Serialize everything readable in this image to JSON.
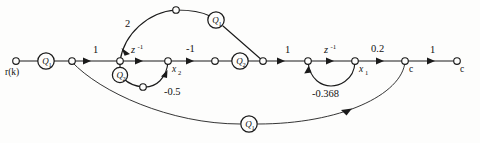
{
  "diagram": {
    "type": "signal-flow-graph",
    "title": "",
    "stroke_color": "#1a1a1a",
    "background_color": "#fdfdfc",
    "nodes": [
      {
        "id": "r",
        "label": "r(k)",
        "label_sub": "",
        "x": 16,
        "y": 61,
        "kind": "open"
      },
      {
        "id": "n1",
        "label": "",
        "label_sub": "",
        "x": 72,
        "y": 61,
        "kind": "open"
      },
      {
        "id": "n2",
        "label": "",
        "label_sub": "",
        "x": 120,
        "y": 61,
        "kind": "open"
      },
      {
        "id": "x2",
        "label": "x",
        "label_sub": "2",
        "x": 168,
        "y": 61,
        "kind": "open"
      },
      {
        "id": "n4",
        "label": "",
        "label_sub": "",
        "x": 215,
        "y": 61,
        "kind": "open"
      },
      {
        "id": "n5",
        "label": "",
        "label_sub": "",
        "x": 263,
        "y": 61,
        "kind": "open"
      },
      {
        "id": "n6",
        "label": "",
        "label_sub": "",
        "x": 308,
        "y": 61,
        "kind": "open"
      },
      {
        "id": "x1",
        "label": "x",
        "label_sub": "1",
        "x": 355,
        "y": 61,
        "kind": "open"
      },
      {
        "id": "c1",
        "label": "c",
        "label_sub": "",
        "x": 405,
        "y": 61,
        "kind": "open"
      },
      {
        "id": "c2",
        "label": "c",
        "label_sub": "",
        "x": 457,
        "y": 61,
        "kind": "open"
      },
      {
        "id": "top_mid",
        "label": "",
        "label_sub": "",
        "x": 176,
        "y": 10,
        "kind": "open"
      },
      {
        "id": "q2_mid",
        "label": "",
        "label_sub": "",
        "x": 143,
        "y": 87,
        "kind": "open"
      }
    ],
    "gain_circles": [
      {
        "id": "q1_in",
        "label": "Q",
        "label_sub": "1",
        "x": 46,
        "y": 61
      },
      {
        "id": "q2_small",
        "label": "Q",
        "label_sub": "2",
        "x": 120,
        "y": 75
      },
      {
        "id": "q1_top",
        "label": "Q",
        "label_sub": "1",
        "x": 216,
        "y": 20
      },
      {
        "id": "q2_mainline",
        "label": "Q",
        "label_sub": "2",
        "x": 240,
        "y": 61
      },
      {
        "id": "q1_bottom",
        "label": "Q",
        "label_sub": "1",
        "x": 249,
        "y": 124
      }
    ],
    "edge_labels": [
      {
        "id": "g_one_a",
        "text": "1",
        "x": 96,
        "y": 50,
        "style": "plain"
      },
      {
        "id": "g_two",
        "text": "2",
        "x": 128,
        "y": 23,
        "style": "plain"
      },
      {
        "id": "g_zinv_1",
        "text": "z",
        "sup": "-1",
        "x": 137,
        "y": 50,
        "style": "sup-italic"
      },
      {
        "id": "g_neg_one",
        "text": "-1",
        "x": 192,
        "y": 49,
        "style": "plain"
      },
      {
        "id": "g_neg_half",
        "text": "-0.5",
        "x": 174,
        "y": 91,
        "style": "plain"
      },
      {
        "id": "g_one_b",
        "text": "1",
        "x": 287,
        "y": 50,
        "style": "plain"
      },
      {
        "id": "g_zinv_2",
        "text": "z",
        "sup": "-1",
        "x": 330,
        "y": 49,
        "style": "sup-italic"
      },
      {
        "id": "g_neg_368",
        "text": "-0.368",
        "x": 332,
        "y": 93,
        "style": "plain"
      },
      {
        "id": "g_point2",
        "text": "0.2",
        "x": 380,
        "y": 49,
        "style": "plain"
      },
      {
        "id": "g_one_c",
        "text": "1",
        "x": 432,
        "y": 50,
        "style": "plain"
      }
    ],
    "branches": [
      {
        "id": "b_r_q1",
        "from": "r",
        "to": "q1_in",
        "gain": ""
      },
      {
        "id": "b_q1_n1",
        "from": "q1_in",
        "to": "n1",
        "gain": ""
      },
      {
        "id": "b_n1_n2",
        "from": "n1",
        "to": "n2",
        "gain": "1"
      },
      {
        "id": "b_n2_x2",
        "from": "n2",
        "to": "x2",
        "gain": "z^-1"
      },
      {
        "id": "b_x2_n4",
        "from": "x2",
        "to": "n4",
        "gain": "-1"
      },
      {
        "id": "b_n4_n5",
        "from": "n4",
        "to": "n5",
        "gain": "Q2"
      },
      {
        "id": "b_n5_n6",
        "from": "n5",
        "to": "n6",
        "gain": "1"
      },
      {
        "id": "b_n6_x1",
        "from": "n6",
        "to": "x1",
        "gain": "z^-1"
      },
      {
        "id": "b_x1_c1",
        "from": "x1",
        "to": "c1",
        "gain": "0.2"
      },
      {
        "id": "b_c1_c2",
        "from": "c1",
        "to": "c2",
        "gain": "1"
      },
      {
        "id": "b_top_arc",
        "from": "n5",
        "to": "n2",
        "gain": "2 Q1"
      },
      {
        "id": "b_q2_loop",
        "from": "x2",
        "to": "n2",
        "gain": "-0.5 Q2"
      },
      {
        "id": "b_x1_loop",
        "from": "x1",
        "to": "n6",
        "gain": "-0.368"
      },
      {
        "id": "b_bottom_arc",
        "from": "c1",
        "to": "n1",
        "gain": "Q1"
      }
    ]
  }
}
